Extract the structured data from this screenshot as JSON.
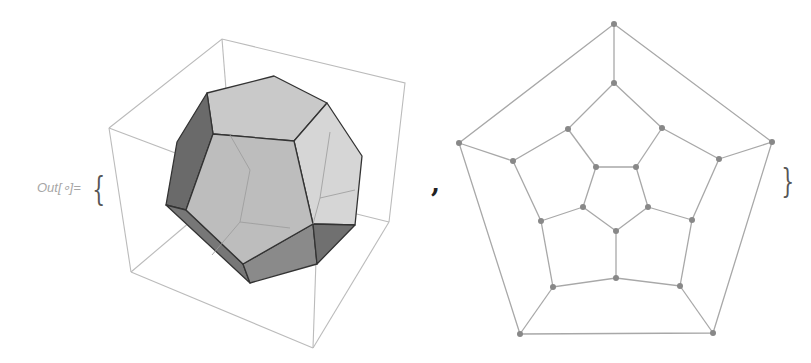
{
  "cell": {
    "out_label": "Out[∘]=",
    "open_brace": "{",
    "separator": ",",
    "close_brace": "}"
  },
  "outputs": [
    {
      "type": "3D graphics",
      "description": "Shaded dodecahedron in bounding box",
      "face_color": "#c8c8c8",
      "edge_color": "#3a3a3a"
    },
    {
      "type": "graph",
      "description": "Dodecahedral graph (Schlegel diagram)",
      "vertex_count": 20,
      "edge_count": 30,
      "vertex_color": "#888888",
      "edge_color": "#aaaaaa"
    }
  ]
}
